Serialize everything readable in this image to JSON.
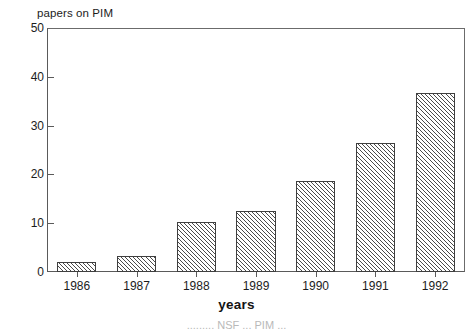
{
  "chart_data": {
    "type": "bar",
    "title": "",
    "ylabel": "papers on PIM",
    "xlabel": "years",
    "categories": [
      "1986",
      "1987",
      "1988",
      "1989",
      "1990",
      "1991",
      "1992"
    ],
    "values": [
      2.1,
      3.2,
      10.3,
      12.4,
      18.6,
      26.5,
      36.7
    ],
    "ylim": [
      0,
      50
    ],
    "yticks": [
      0,
      10,
      20,
      30,
      40,
      50
    ],
    "ytick_labels": [
      "0",
      "10",
      "20",
      "30",
      "40",
      "50"
    ],
    "grid": false,
    "legend": null,
    "bar_fill": "diagonal-hatch",
    "bar_edge_color": "#3f3f3f",
    "axis_color": "#5a5a5a",
    "background": "#ffffff"
  },
  "caption": {
    "partial_text": "......... NSF ... PIM ..."
  }
}
